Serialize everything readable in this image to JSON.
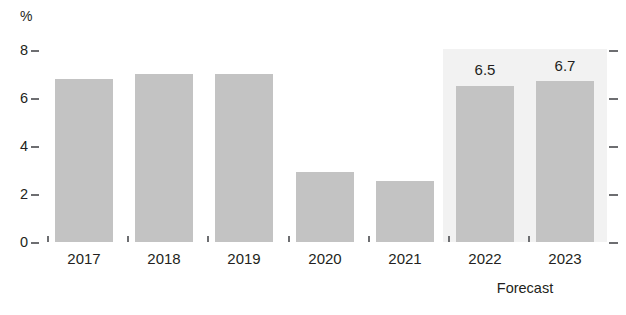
{
  "chart_data": {
    "type": "bar",
    "title": "",
    "subtitle": "",
    "xlabel": "",
    "ylabel": "%",
    "unit": "%",
    "categories": [
      "2017",
      "2018",
      "2019",
      "2020",
      "2021",
      "2022",
      "2023"
    ],
    "values": [
      6.8,
      7.0,
      7.0,
      2.9,
      2.55,
      6.5,
      6.7
    ],
    "data_labels": [
      "",
      "",
      "",
      "",
      "",
      "6.5",
      "6.7"
    ],
    "series": [
      {
        "name": "",
        "values": [
          6.8,
          7.0,
          7.0,
          2.9,
          2.55,
          6.5,
          6.7
        ]
      }
    ],
    "ylim": [
      0,
      8
    ],
    "yticks": [
      "0",
      "2",
      "4",
      "6",
      "8"
    ],
    "ytick_values": [
      0,
      2,
      4,
      6,
      8
    ],
    "grid": false,
    "legend": null,
    "legend_position": "none",
    "annotations": [
      {
        "text": "Forecast",
        "covers": [
          "2022",
          "2023"
        ]
      }
    ],
    "colors": {
      "bar": "#c3c3c3",
      "forecast_band": "#f2f2f2",
      "axis": "#6d6e71",
      "text": "#231f20",
      "background": "#ffffff"
    }
  },
  "axis": {
    "unit_label": "%",
    "y_ticks": [
      {
        "label": "8",
        "value": 8
      },
      {
        "label": "6",
        "value": 6
      },
      {
        "label": "4",
        "value": 4
      },
      {
        "label": "2",
        "value": 2
      },
      {
        "label": "0",
        "value": 0
      }
    ]
  },
  "bars": [
    {
      "category": "2017",
      "value": 6.8,
      "label": ""
    },
    {
      "category": "2018",
      "value": 7.0,
      "label": ""
    },
    {
      "category": "2019",
      "value": 7.0,
      "label": ""
    },
    {
      "category": "2020",
      "value": 2.9,
      "label": ""
    },
    {
      "category": "2021",
      "value": 2.55,
      "label": ""
    },
    {
      "category": "2022",
      "value": 6.5,
      "label": "6.5"
    },
    {
      "category": "2023",
      "value": 6.7,
      "label": "6.7"
    }
  ],
  "forecast": {
    "caption": "Forecast"
  }
}
